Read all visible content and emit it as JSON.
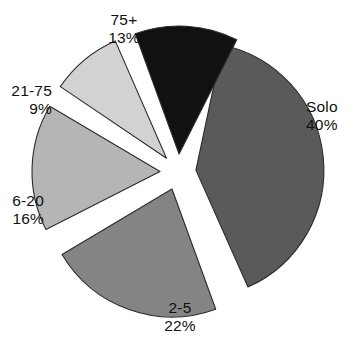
{
  "chart_data": {
    "type": "pie",
    "title": "",
    "subtitle": "",
    "xlabel": "",
    "ylabel": "",
    "legend_position": "none",
    "grid": false,
    "exploded": true,
    "total_percent": 100,
    "categories": [
      "Solo",
      "2-5",
      "6-20",
      "21-75",
      "75+"
    ],
    "values": [
      40,
      22,
      16,
      9,
      13
    ],
    "value_suffix": "%",
    "slices": [
      {
        "name": "Solo",
        "label": "Solo",
        "value": 40,
        "value_label": "40%",
        "color": "#5a5a5a",
        "start_angle_deg": 12,
        "sweep_deg": 144,
        "explode": 18,
        "label_x": 306,
        "label_y": 112,
        "label_anchor": "start"
      },
      {
        "name": "2-5",
        "label": "2-5",
        "value": 22,
        "value_label": "22%",
        "color": "#848484",
        "start_angle_deg": 160,
        "sweep_deg": 79.2,
        "explode": 18,
        "label_x": 180,
        "label_y": 313,
        "label_anchor": "middle"
      },
      {
        "name": "6-20",
        "label": "6-20",
        "value": 16,
        "value_label": "16%",
        "color": "#b5b5b5",
        "start_angle_deg": 243,
        "sweep_deg": 57.6,
        "explode": 18,
        "label_x": 44,
        "label_y": 206,
        "label_anchor": "end"
      },
      {
        "name": "21-75",
        "label": "21-75",
        "value": 9,
        "value_label": "9%",
        "color": "#d2d2d2",
        "start_angle_deg": 304,
        "sweep_deg": 32.4,
        "explode": 18,
        "label_x": 52,
        "label_y": 96,
        "label_anchor": "end"
      },
      {
        "name": "75+",
        "label": "75+",
        "value": 13,
        "value_label": "13%",
        "color": "#111111",
        "start_angle_deg": 340,
        "sweep_deg": 46.8,
        "explode": 18,
        "label_x": 124,
        "label_y": 25,
        "label_anchor": "middle"
      }
    ]
  },
  "geometry": {
    "center_x": 178,
    "center_y": 172,
    "radius": 128,
    "stroke_color": "#2b2b2b",
    "background": "#ffffff"
  }
}
